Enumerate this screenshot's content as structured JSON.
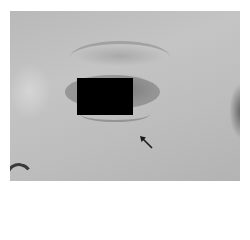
{
  "image": {
    "description": "Grayscale clinical photograph of an infant's periocular region",
    "redaction": {
      "shape": "rectangle",
      "color": "#000000"
    },
    "annotation": {
      "type": "arrow",
      "direction": "pointing up-left",
      "target": "lower eyelid region",
      "color": "#1a1a1a"
    },
    "border_color": "#ffffff"
  }
}
